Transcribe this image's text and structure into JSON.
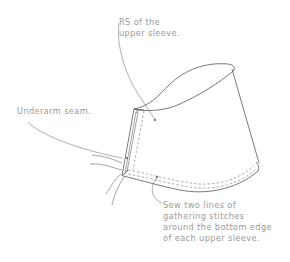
{
  "figure": {
    "callouts": [
      {
        "id": "rs",
        "text": "RS of the\nupper sleeve."
      },
      {
        "id": "underarm",
        "text": "Underarm seam."
      },
      {
        "id": "gathering",
        "text": "Sew two lines of\ngathering stitches\naround the bottom edge\nof each upper sleeve."
      }
    ]
  },
  "colors": {
    "label_text": "#9a9a9a",
    "line_art": "#555555",
    "background": "#ffffff"
  }
}
